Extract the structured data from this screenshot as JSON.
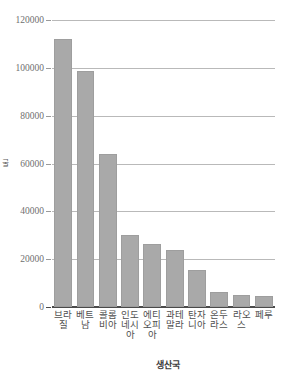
{
  "chart_data": {
    "type": "bar",
    "title": "",
    "subtitle": "",
    "xlabel": "생산국",
    "ylabel": "톤",
    "categories": [
      "브라질",
      "베트남",
      "콜롬비아",
      "인도네시아",
      "에티오피아",
      "과테말라",
      "탄자니아",
      "온두라스",
      "라오스",
      "페루"
    ],
    "values": [
      112000,
      98500,
      64000,
      30000,
      26500,
      24000,
      15500,
      6200,
      5200,
      4600
    ],
    "ylim": [
      0,
      120000
    ],
    "yticks": [
      0,
      20000,
      40000,
      60000,
      80000,
      100000,
      120000
    ],
    "ytick_labels": [
      "0",
      "20000",
      "40000",
      "60000",
      "80000",
      "100000",
      "120000"
    ],
    "grid": true,
    "grid_axis": "y",
    "legend": false,
    "legend_position": "none",
    "bar_color": "#a9a9a9",
    "grid_color": "#b9b9b9",
    "axis_color": "#4a4a4a",
    "text_color": "#6f6f6f"
  }
}
